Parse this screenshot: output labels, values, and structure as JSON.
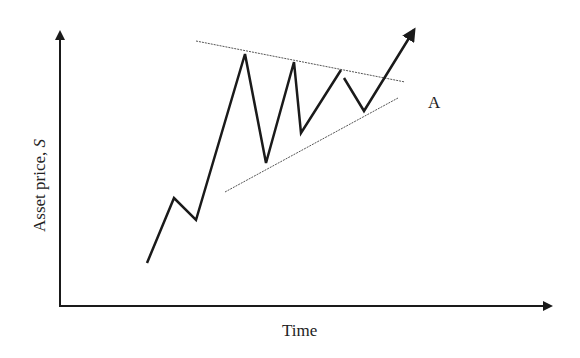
{
  "diagram": {
    "type": "symmetrical-triangle-breakout",
    "x_axis_label": "Time",
    "y_axis_label_prefix": "Asset price, ",
    "y_axis_label_var": "S",
    "point_label": "A",
    "colors": {
      "line": "#1a1a1a",
      "trend": "#555555",
      "text": "#222222",
      "background": "#ffffff"
    },
    "price_path": [
      [
        147,
        263
      ],
      [
        174,
        198
      ],
      [
        196,
        220
      ],
      [
        245,
        54
      ],
      [
        266,
        163
      ],
      [
        294,
        62
      ],
      [
        301,
        133
      ],
      [
        341,
        70
      ]
    ],
    "price_path_2": [
      [
        344,
        78
      ],
      [
        364,
        111
      ],
      [
        412,
        33
      ]
    ],
    "upper_trendline": [
      [
        196,
        41
      ],
      [
        405,
        82
      ]
    ],
    "lower_trendline": [
      [
        225,
        192
      ],
      [
        398,
        98
      ]
    ]
  }
}
